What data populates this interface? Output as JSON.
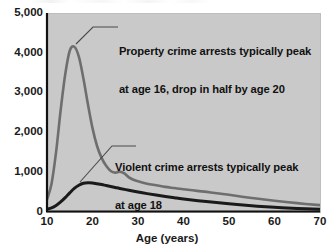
{
  "chart_data": {
    "type": "line",
    "title": "",
    "xlabel": "Age (years)",
    "ylabel": "",
    "xlim": [
      10,
      70
    ],
    "ylim": [
      0,
      5000
    ],
    "grid": false,
    "legend_position": "none",
    "x_ticks": [
      "10",
      "20",
      "30",
      "40",
      "50",
      "60",
      "70"
    ],
    "y_ticks": [
      "0",
      "1,000",
      "2,000",
      "3,000",
      "4,000",
      "5,000"
    ],
    "series": [
      {
        "name": "Property crime arrests",
        "color": "#6e6e6e",
        "x": [
          10,
          11,
          12,
          13,
          14,
          15,
          16,
          17,
          18,
          19,
          20,
          21,
          22,
          23,
          24,
          25,
          26,
          27,
          28,
          29,
          30,
          32,
          34,
          36,
          38,
          40,
          43,
          46,
          50,
          55,
          60,
          65,
          70
        ],
        "values": [
          300,
          700,
          1500,
          2550,
          3450,
          4050,
          4150,
          3900,
          3350,
          2700,
          2100,
          1650,
          1350,
          1150,
          1020,
          980,
          1000,
          960,
          860,
          800,
          760,
          700,
          660,
          620,
          590,
          560,
          520,
          480,
          420,
          340,
          270,
          210,
          160
        ]
      },
      {
        "name": "Violent crime arrests",
        "color": "#1a1a1a",
        "x": [
          10,
          11,
          12,
          13,
          14,
          15,
          16,
          17,
          18,
          19,
          20,
          21,
          22,
          23,
          24,
          25,
          26,
          28,
          30,
          32,
          35,
          38,
          40,
          45,
          50,
          55,
          60,
          65,
          70
        ],
        "values": [
          60,
          90,
          150,
          240,
          350,
          470,
          580,
          660,
          710,
          725,
          720,
          700,
          680,
          655,
          630,
          605,
          580,
          535,
          490,
          450,
          395,
          345,
          315,
          250,
          195,
          145,
          105,
          75,
          55
        ]
      }
    ],
    "annotations": [
      {
        "id": "property",
        "line1": "Property crime arrests typically peak",
        "line2": "at age 16, drop in half by age 20",
        "points_to_age": 16,
        "points_to_value": 4150
      },
      {
        "id": "violent",
        "line1": "Violent crime arrests typically peak",
        "line2": "at age 18",
        "points_to_age": 18,
        "points_to_value": 710
      }
    ]
  },
  "axis": {
    "x_title": "Age (years)"
  },
  "ticks": {
    "y": [
      {
        "label": "5,000",
        "value": 5000
      },
      {
        "label": "4,000",
        "value": 4000
      },
      {
        "label": "3,000",
        "value": 3000
      },
      {
        "label": "2,000",
        "value": 2000
      },
      {
        "label": "1,000",
        "value": 1000
      },
      {
        "label": "0",
        "value": 0
      }
    ],
    "x": [
      {
        "label": "10",
        "value": 10
      },
      {
        "label": "20",
        "value": 20
      },
      {
        "label": "30",
        "value": 30
      },
      {
        "label": "40",
        "value": 40
      },
      {
        "label": "50",
        "value": 50
      },
      {
        "label": "60",
        "value": 60
      },
      {
        "label": "70",
        "value": 70
      }
    ]
  },
  "annotations": {
    "property": {
      "line1": "Property crime arrests typically peak",
      "line2": "at age 16, drop in half by age 20"
    },
    "violent": {
      "line1": "Violent crime arrests typically peak",
      "line2": "at age 18"
    }
  },
  "colors": {
    "panel": "#c9c9c9",
    "property_line": "#6e6e6e",
    "violent_line": "#1a1a1a",
    "axis": "#111111",
    "text": "#111111"
  }
}
